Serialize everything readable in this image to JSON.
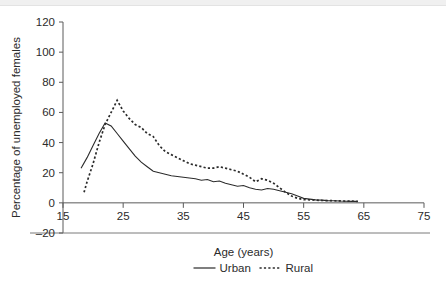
{
  "chart_data": {
    "type": "line",
    "title": "",
    "xlabel": "Age (years)",
    "ylabel": "Percentage of unemployed females",
    "xlim": [
      15,
      75
    ],
    "ylim": [
      -20,
      120
    ],
    "xticks": [
      15,
      25,
      35,
      45,
      55,
      65,
      75
    ],
    "yticks": [
      -20,
      0,
      20,
      40,
      60,
      80,
      100,
      120
    ],
    "grid": false,
    "legend_position": "bottom-center",
    "series": [
      {
        "name": "Urban",
        "style": "solid",
        "color": "#2b2b2b",
        "x": [
          18,
          19,
          20,
          21,
          22,
          23,
          24,
          25,
          26,
          27,
          28,
          29,
          30,
          31,
          32,
          33,
          34,
          35,
          36,
          37,
          38,
          39,
          40,
          41,
          42,
          43,
          44,
          45,
          46,
          47,
          48,
          49,
          50,
          51,
          52,
          53,
          54,
          55,
          56,
          57,
          58,
          59,
          60,
          61,
          62,
          63,
          64
        ],
        "y": [
          23,
          30,
          38,
          46,
          53,
          51,
          46,
          41,
          36,
          31,
          27,
          24,
          21,
          20,
          19,
          18,
          17.5,
          17,
          16.5,
          16,
          15,
          15.5,
          14,
          14.5,
          13,
          12,
          11,
          11.5,
          10,
          9,
          8.5,
          9.5,
          9,
          8,
          7,
          6,
          4.5,
          3,
          2.5,
          2,
          1.8,
          1.5,
          1.4,
          1.2,
          1.1,
          1,
          1
        ]
      },
      {
        "name": "Rural",
        "style": "dotted",
        "color": "#2b2b2b",
        "x": [
          18.5,
          19,
          20,
          21,
          22,
          23,
          24,
          25,
          26,
          27,
          28,
          29,
          30,
          31,
          32,
          33,
          34,
          35,
          36,
          37,
          38,
          39,
          40,
          41,
          42,
          43,
          44,
          45,
          46,
          47,
          48,
          49,
          50,
          51,
          52,
          53,
          54,
          55,
          56,
          57,
          58,
          59,
          60,
          61,
          62,
          63,
          64
        ],
        "y": [
          7,
          14,
          26,
          40,
          52,
          60,
          68,
          61,
          56,
          52,
          50,
          46,
          44,
          38,
          34,
          32,
          30,
          28,
          26,
          25,
          24,
          23,
          23,
          24,
          23,
          22,
          21,
          19,
          17,
          14,
          16,
          15,
          13,
          10,
          7,
          4.5,
          3,
          2.2,
          2,
          1.8,
          1.6,
          1.5,
          1.4,
          1.3,
          1.2,
          1.1,
          1
        ]
      }
    ]
  },
  "axes": {
    "ylabel": "Percentage of unemployed females",
    "xlabel": "Age (years)",
    "ytick_labels": [
      "120",
      "100",
      "80",
      "60",
      "40",
      "20",
      "0",
      "–20"
    ],
    "ytick_values": [
      120,
      100,
      80,
      60,
      40,
      20,
      0,
      -20
    ],
    "xtick_labels": [
      "15",
      "25",
      "35",
      "45",
      "55",
      "65",
      "75"
    ],
    "xtick_values": [
      15,
      25,
      35,
      45,
      55,
      65,
      75
    ]
  },
  "legend": {
    "entries": [
      {
        "label": "Urban",
        "style": "solid"
      },
      {
        "label": "Rural",
        "style": "dotted"
      }
    ]
  }
}
